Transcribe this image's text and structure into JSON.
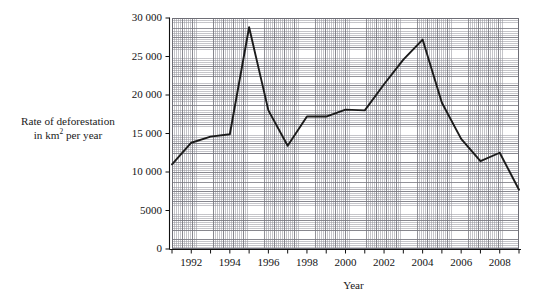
{
  "chart_data": {
    "type": "line",
    "title": "",
    "subtitle": "",
    "xlabel": "Year",
    "ylabel_line1": "Rate of deforestation",
    "ylabel_line2_pre": "in km",
    "ylabel_line2_sup": "2",
    "ylabel_line2_post": " per year",
    "ylabel_plain": "Rate of deforestation in km2 per year",
    "grid": true,
    "grid_style": "graph-paper",
    "legend": "none",
    "xlim": [
      1991,
      2009
    ],
    "ylim": [
      0,
      30000
    ],
    "x": [
      1991,
      1992,
      1993,
      1994,
      1995,
      1996,
      1997,
      1998,
      1999,
      2000,
      2001,
      2002,
      2003,
      2004,
      2005,
      2006,
      2007,
      2008,
      2009
    ],
    "values": [
      11000,
      13800,
      14600,
      14900,
      28800,
      18000,
      13400,
      17200,
      17200,
      18100,
      18000,
      21400,
      24600,
      27200,
      19000,
      14300,
      11400,
      12500,
      7700
    ],
    "series": [
      {
        "name": "Rate of deforestation",
        "color": "#1b1b1b",
        "values": [
          11000,
          13800,
          14600,
          14900,
          28800,
          18000,
          13400,
          17200,
          17200,
          18100,
          18000,
          21400,
          24600,
          27200,
          19000,
          14300,
          11400,
          12500,
          7700
        ]
      }
    ],
    "yticks": [
      0,
      5000,
      10000,
      15000,
      20000,
      25000,
      30000
    ],
    "ytick_labels": [
      "0",
      "5000",
      "10 000",
      "15 000",
      "20 000",
      "25 000",
      "30 000"
    ],
    "xticks": [
      1992,
      1994,
      1996,
      1998,
      2000,
      2002,
      2004,
      2006,
      2008
    ],
    "xtick_labels": [
      "1992",
      "1994",
      "1996",
      "1998",
      "2000",
      "2002",
      "2004",
      "2006",
      "2008"
    ],
    "xtick_all": [
      1991,
      1992,
      1993,
      1994,
      1995,
      1996,
      1997,
      1998,
      1999,
      2000,
      2001,
      2002,
      2003,
      2004,
      2005,
      2006,
      2007,
      2008,
      2009
    ]
  },
  "colors": {
    "line": "#1b1b1b",
    "axis": "#111111",
    "grid_major": "#787880",
    "grid_minor": "#9696a0",
    "background": "#ffffff",
    "text": "#141414"
  }
}
